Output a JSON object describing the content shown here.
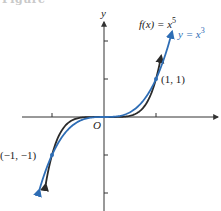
{
  "figure_caption": "Figure",
  "chart_data": {
    "type": "line",
    "title": "",
    "xlabel": "",
    "ylabel": "y",
    "origin_label": "O",
    "xlim": [
      -1.6,
      2.2
    ],
    "ylim": [
      -2.3,
      2.5
    ],
    "x_ticks": [
      -1,
      1
    ],
    "y_ticks": [
      -2,
      -1,
      1,
      2
    ],
    "grid": false,
    "series": [
      {
        "name": "f(x) = x^5",
        "label_prefix": "f(x) = x",
        "label_exp": "5",
        "exponent": 5,
        "color": "#2a2a2a",
        "x_range": [
          -1.12,
          1.1
        ]
      },
      {
        "name": "y = x^3",
        "label_prefix": "y = x",
        "label_exp": "3",
        "exponent": 3,
        "color": "#2e6db5",
        "x_range": [
          -1.24,
          1.31
        ]
      }
    ],
    "points": [
      {
        "x": 1,
        "y": 1,
        "label": "(1, 1)"
      },
      {
        "x": -1,
        "y": -1,
        "label": "(−1, −1)"
      }
    ]
  },
  "colors": {
    "axis": "#333333",
    "point": "#2e6db5"
  }
}
